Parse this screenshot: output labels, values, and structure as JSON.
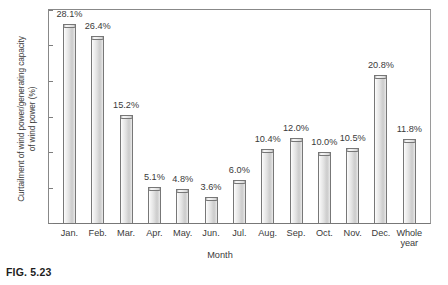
{
  "figure": {
    "caption": "FIG. 5.23"
  },
  "chart_data": {
    "type": "bar",
    "title": "",
    "subtitle": "",
    "xlabel": "Month",
    "ylabel": "Curtailment of wind power/generating capacity\nof wind power (%)",
    "categories": [
      "Jan.",
      "Feb.",
      "Mar.",
      "Apr.",
      "May.",
      "Jun.",
      "Jul.",
      "Aug.",
      "Sep.",
      "Oct.",
      "Nov.",
      "Dec.",
      "Whole year"
    ],
    "values": [
      28.1,
      26.4,
      15.2,
      5.1,
      4.8,
      3.6,
      6.0,
      10.4,
      12.0,
      10.0,
      10.5,
      20.8,
      11.8
    ],
    "data_labels": [
      "28.1%",
      "26.4%",
      "15.2%",
      "5.1%",
      "4.8%",
      "3.6%",
      "6.0%",
      "10.4%",
      "12.0%",
      "10.0%",
      "10.5%",
      "20.8%",
      "11.8%"
    ],
    "ylim": [
      0,
      30
    ],
    "yticks": [
      0,
      5,
      10,
      15,
      20,
      25,
      30
    ],
    "ytick_labels": [
      "0",
      "5",
      "10",
      "15",
      "20",
      "25",
      "30"
    ],
    "grid": false,
    "legend": null,
    "legend_position": "none",
    "bar_face_color": "#e2e2e2",
    "bar_edge_color": "#777777",
    "axis_color": "#888888",
    "text_color": "#3a3a3a",
    "background_color": "#ffffff"
  }
}
